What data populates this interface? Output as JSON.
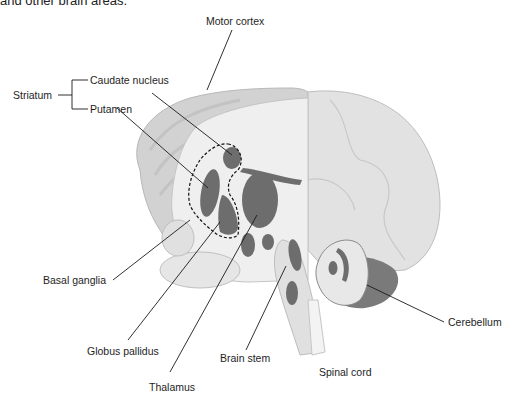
{
  "caption": "and other brain areas.",
  "labels": {
    "motor_cortex": "Motor cortex",
    "striatum": "Striatum",
    "caudate_nucleus": "Caudate nucleus",
    "putamen": "Putamen",
    "basal_ganglia": "Basal ganglia",
    "globus_pallidus": "Globus pallidus",
    "thalamus": "Thalamus",
    "brain_stem": "Brain stem",
    "spinal_cord": "Spinal cord",
    "cerebellum": "Cerebellum"
  },
  "colors": {
    "background": "#ffffff",
    "brain_light": "#e4e4e4",
    "brain_mid": "#cfcfcf",
    "brain_section": "#ececec",
    "structure_dark": "#6b6b6b",
    "cerebellum_dark": "#7a7a7a",
    "leader_line": "#1a1a1a"
  }
}
